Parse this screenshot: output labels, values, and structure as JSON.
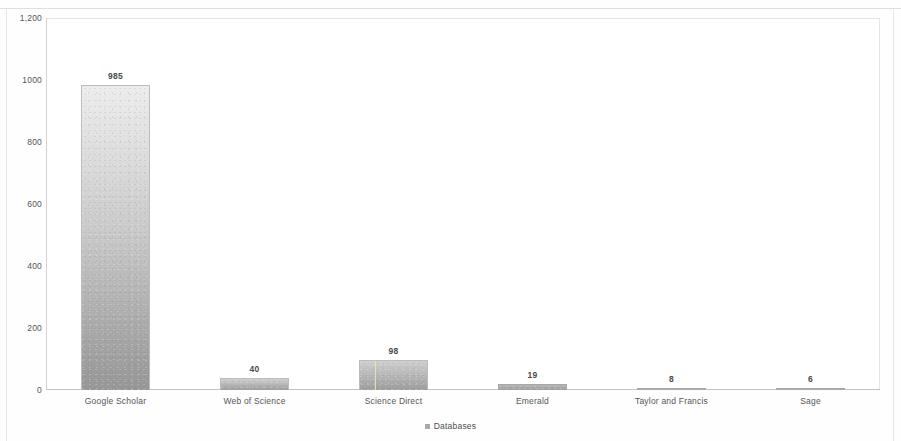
{
  "chart_data": {
    "type": "bar",
    "title": "",
    "subtitle": "",
    "xlabel": "",
    "ylabel": "",
    "categories": [
      "Google Scholar",
      "Web of Science",
      "Science Direct",
      "Emerald",
      "Taylor and Francis",
      "Sage"
    ],
    "values": [
      985,
      40,
      98,
      19,
      8,
      6
    ],
    "value_labels": [
      "985",
      "40",
      "98",
      "19",
      "8",
      "6"
    ],
    "series": [
      {
        "name": "Databases",
        "values": [
          985,
          40,
          98,
          19,
          8,
          6
        ]
      }
    ],
    "ylim": [
      0,
      1200
    ],
    "y_ticks": [
      0,
      200,
      400,
      600,
      800,
      1000,
      1200
    ],
    "y_tick_labels": [
      "0",
      "200",
      "400",
      "600",
      "800",
      "1000",
      "1,200"
    ],
    "grid": false,
    "legend": {
      "position": "bottom",
      "entries": [
        {
          "label": "Databases",
          "marker": "square",
          "color": "#a9a9a9"
        }
      ]
    },
    "bar_colors": {
      "fill_top": "#ececec",
      "fill_bottom": "#969696",
      "border": "#bcbcbc"
    },
    "plot_frame_color": "#dcdcdc",
    "text_color": "#555555"
  },
  "legend": {
    "label": "Databases",
    "marker_name": "legend-square-marker"
  }
}
